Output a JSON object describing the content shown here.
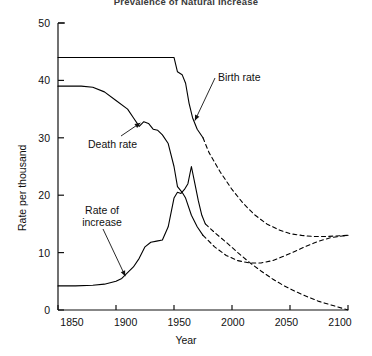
{
  "chart": {
    "title": "Prevalence of Natural Increase",
    "xlabel": "Year",
    "ylabel": "Rate per thousand",
    "x_ticks": [
      "1850",
      "1900",
      "1950",
      "2000",
      "2050",
      "2100"
    ],
    "y_ticks": [
      "0",
      "10",
      "20",
      "30",
      "40",
      "50"
    ]
  },
  "annotations": {
    "birth": "Birth rate",
    "death": "Death rate",
    "increase_line1": "Rate of",
    "increase_line2": "increase"
  },
  "chart_data": {
    "type": "line",
    "title": "Prevalence of Natural Increase",
    "xlabel": "Year",
    "ylabel": "Rate per thousand",
    "xlim": [
      1850,
      2100
    ],
    "ylim": [
      0,
      50
    ],
    "x_ticks": [
      1850,
      1900,
      1950,
      2000,
      2050,
      2100
    ],
    "y_ticks": [
      0,
      10,
      20,
      30,
      40,
      50
    ],
    "grid": false,
    "legend": "inline-annotations",
    "line_color": "#000000",
    "solid_style": "historical data",
    "dashed_style": "projection",
    "series": [
      {
        "name": "Birth rate",
        "style": "solid",
        "points": [
          [
            1850,
            44.0
          ],
          [
            1860,
            44.0
          ],
          [
            1870,
            44.0
          ],
          [
            1880,
            44.0
          ],
          [
            1890,
            44.0
          ],
          [
            1900,
            44.0
          ],
          [
            1910,
            44.0
          ],
          [
            1920,
            44.0
          ],
          [
            1930,
            44.0
          ],
          [
            1940,
            44.0
          ],
          [
            1950,
            44.0
          ],
          [
            1953,
            41.5
          ],
          [
            1957,
            41.0
          ],
          [
            1960,
            39.5
          ],
          [
            1963,
            36.0
          ],
          [
            1966,
            33.5
          ],
          [
            1970,
            31.5
          ],
          [
            1975,
            30.0
          ]
        ]
      },
      {
        "name": "Birth rate (projected)",
        "style": "dashed",
        "points": [
          [
            1975,
            30.0
          ],
          [
            1980,
            27.5
          ],
          [
            1990,
            24.0
          ],
          [
            2000,
            21.0
          ],
          [
            2010,
            18.5
          ],
          [
            2020,
            16.5
          ],
          [
            2030,
            15.0
          ],
          [
            2040,
            14.0
          ],
          [
            2050,
            13.3
          ],
          [
            2060,
            13.0
          ],
          [
            2070,
            12.8
          ],
          [
            2080,
            12.8
          ],
          [
            2090,
            12.9
          ],
          [
            2100,
            13.0
          ]
        ]
      },
      {
        "name": "Death rate",
        "style": "solid",
        "points": [
          [
            1850,
            39.0
          ],
          [
            1860,
            39.0
          ],
          [
            1870,
            39.0
          ],
          [
            1880,
            38.8
          ],
          [
            1890,
            38.0
          ],
          [
            1900,
            36.5
          ],
          [
            1910,
            35.0
          ],
          [
            1915,
            33.5
          ],
          [
            1920,
            32.0
          ],
          [
            1924,
            32.8
          ],
          [
            1928,
            32.5
          ],
          [
            1932,
            31.5
          ],
          [
            1936,
            31.3
          ],
          [
            1940,
            30.5
          ],
          [
            1945,
            29.0
          ],
          [
            1950,
            25.0
          ],
          [
            1953,
            21.5
          ],
          [
            1957,
            20.5
          ],
          [
            1960,
            19.5
          ],
          [
            1965,
            16.5
          ],
          [
            1970,
            14.5
          ],
          [
            1975,
            13.0
          ]
        ]
      },
      {
        "name": "Death rate (projected)",
        "style": "dashed",
        "points": [
          [
            1975,
            13.0
          ],
          [
            1985,
            11.0
          ],
          [
            1995,
            9.5
          ],
          [
            2005,
            8.6
          ],
          [
            2015,
            8.2
          ],
          [
            2025,
            8.2
          ],
          [
            2035,
            8.6
          ],
          [
            2045,
            9.4
          ],
          [
            2055,
            10.3
          ],
          [
            2065,
            11.2
          ],
          [
            2075,
            12.0
          ],
          [
            2085,
            12.6
          ],
          [
            2095,
            12.9
          ],
          [
            2100,
            13.0
          ]
        ]
      },
      {
        "name": "Rate of increase",
        "style": "solid",
        "points": [
          [
            1850,
            4.2
          ],
          [
            1865,
            4.2
          ],
          [
            1880,
            4.3
          ],
          [
            1890,
            4.5
          ],
          [
            1900,
            5.0
          ],
          [
            1905,
            5.5
          ],
          [
            1910,
            6.5
          ],
          [
            1915,
            7.5
          ],
          [
            1920,
            9.0
          ],
          [
            1925,
            11.0
          ],
          [
            1930,
            11.8
          ],
          [
            1935,
            12.0
          ],
          [
            1940,
            12.2
          ],
          [
            1945,
            14.5
          ],
          [
            1950,
            19.5
          ],
          [
            1953,
            20.5
          ],
          [
            1956,
            20.3
          ],
          [
            1959,
            21.0
          ],
          [
            1962,
            22.0
          ],
          [
            1965,
            25.0
          ],
          [
            1968,
            22.0
          ],
          [
            1971,
            19.0
          ],
          [
            1974,
            16.5
          ],
          [
            1977,
            15.0
          ]
        ]
      },
      {
        "name": "Rate of increase (projected)",
        "style": "dashed",
        "points": [
          [
            1977,
            15.0
          ],
          [
            1985,
            13.5
          ],
          [
            1995,
            11.8
          ],
          [
            2005,
            10.0
          ],
          [
            2015,
            8.3
          ],
          [
            2025,
            6.8
          ],
          [
            2035,
            5.4
          ],
          [
            2045,
            4.2
          ],
          [
            2055,
            3.2
          ],
          [
            2065,
            2.3
          ],
          [
            2075,
            1.5
          ],
          [
            2085,
            0.9
          ],
          [
            2095,
            0.3
          ],
          [
            2100,
            0.0
          ]
        ]
      }
    ],
    "annotations": [
      {
        "text": "Birth rate",
        "target_x": 1968,
        "target_y": 33.0
      },
      {
        "text": "Death rate",
        "target_x": 1921,
        "target_y": 32.6
      },
      {
        "text": "Rate of increase",
        "target_x": 1908,
        "target_y": 5.9
      }
    ]
  }
}
